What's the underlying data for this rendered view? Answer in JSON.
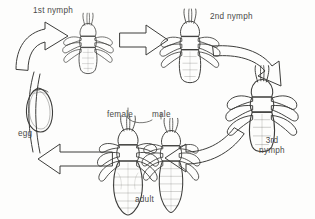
{
  "diagram": {
    "background_color": "#fdfdfc",
    "ink_color": "#3d3d3b",
    "label_color": "#4a4a48",
    "stages": [
      {
        "id": "egg",
        "label": "egg",
        "x": 18,
        "y": 129,
        "order": 1
      },
      {
        "id": "nymph1",
        "label": "1st nymph",
        "x": 33,
        "y": 6,
        "order": 2
      },
      {
        "id": "nymph2",
        "label": "2nd nymph",
        "x": 210,
        "y": 12,
        "order": 3
      },
      {
        "id": "nymph3",
        "label": "3rd\nnymph",
        "x": 255,
        "y": 136,
        "order": 4
      },
      {
        "id": "female",
        "label": "female",
        "x": 107,
        "y": 110,
        "order": 5
      },
      {
        "id": "male",
        "label": "male",
        "x": 152,
        "y": 110,
        "order": 6
      },
      {
        "id": "adult",
        "label": "adult",
        "x": 135,
        "y": 195,
        "order": 7
      }
    ],
    "arrows": [
      {
        "id": "egg-to-nymph1",
        "from": "egg",
        "to": "nymph1",
        "style": "curved-block"
      },
      {
        "id": "nymph1-to-nymph2",
        "from": "nymph1",
        "to": "nymph2",
        "style": "straight-block"
      },
      {
        "id": "nymph2-to-nymph3",
        "from": "nymph2",
        "to": "nymph3",
        "style": "curved-block"
      },
      {
        "id": "nymph3-to-adult",
        "from": "nymph3",
        "to": "adult",
        "style": "curved-block"
      },
      {
        "id": "adult-to-egg",
        "from": "adult",
        "to": "egg",
        "style": "curved-block"
      }
    ]
  }
}
